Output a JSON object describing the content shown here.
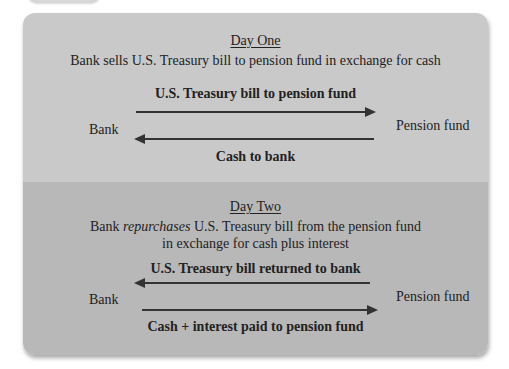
{
  "day_one": {
    "title": "Day One",
    "description": "Bank sells U.S. Treasury bill to pension fund in exchange for cash",
    "top_arrow_label": "U.S. Treasury bill to pension fund",
    "top_arrow_direction": "right",
    "bottom_arrow_label": "Cash to bank",
    "bottom_arrow_direction": "left",
    "left_party": "Bank",
    "right_party": "Pension fund"
  },
  "day_two": {
    "title": "Day Two",
    "description_prefix": "Bank ",
    "description_emphasis": "repurchases",
    "description_suffix": " U.S. Treasury bill from the pension fund",
    "description_line2": "in exchange for cash plus interest",
    "top_arrow_label": "U.S. Treasury bill returned to bank",
    "top_arrow_direction": "left",
    "bottom_arrow_label": "Cash + interest paid to pension fund",
    "bottom_arrow_direction": "right",
    "left_party": "Bank",
    "right_party": "Pension fund"
  },
  "colors": {
    "day_one_bg": "#c9c9c9",
    "day_two_bg": "#b8b8b8",
    "arrow": "#333333"
  }
}
